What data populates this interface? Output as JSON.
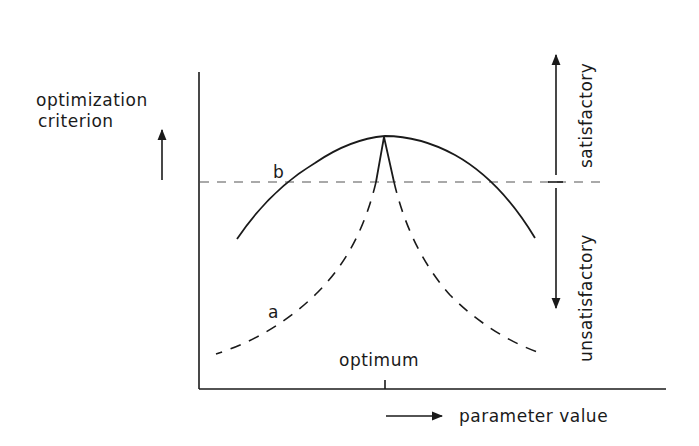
{
  "diagram": {
    "y_axis_label_line1": "optimization",
    "y_axis_label_line2": "criterion",
    "x_axis_label": "parameter value",
    "optimum_label": "optimum",
    "curve_a_label": "a",
    "curve_b_label": "b",
    "region_above_label": "satisfactory",
    "region_below_label": "unsatisfactory",
    "curves": [
      {
        "id": "a",
        "style": "dashed",
        "description": "sharply peaked criterion; narrow satisfactory range"
      },
      {
        "id": "b",
        "style": "solid",
        "description": "broad criterion; wide satisfactory range"
      }
    ],
    "threshold": {
      "style": "dashed",
      "meaning": "boundary between satisfactory and unsatisfactory"
    }
  }
}
